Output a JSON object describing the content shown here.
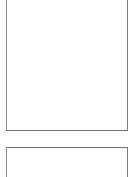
{
  "document": {
    "title": "",
    "background_color": "#ffffff",
    "viewport": {
      "width": 135,
      "height": 177
    }
  },
  "panels": [
    {
      "id": "panel-1",
      "name": "blank-page-1",
      "label": "",
      "content": "",
      "border_color": "#8c8c8c",
      "fill_color": "#ffffff",
      "clipped_top": true,
      "clipped_bottom": false
    },
    {
      "id": "panel-2",
      "name": "blank-page-2",
      "label": "",
      "content": "",
      "border_color": "#8c8c8c",
      "fill_color": "#ffffff",
      "clipped_top": false,
      "clipped_bottom": true
    }
  ],
  "separator": {
    "name": "page-gap",
    "color": "#ffffff"
  }
}
